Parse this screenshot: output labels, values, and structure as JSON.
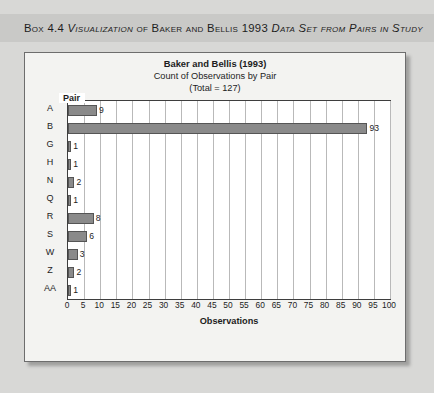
{
  "box": {
    "heading_prefix": "Box 4.4 ",
    "heading_italic_1": "Visualization",
    "heading_mid": " of Baker and Bellis 1993 ",
    "heading_italic_2": "Data Set from Pairs in Study",
    "heading_full": "Box 4.4 Visualization of Baker and Bellis 1993 Data Set from Pairs in Study"
  },
  "chart_data": {
    "type": "bar",
    "orientation": "horizontal",
    "title": "Baker and Bellis (1993)",
    "subtitle": "Count of Observations by Pair",
    "total_line": "(Total = 127)",
    "total": 127,
    "xlabel": "Observations",
    "ylabel": "Pair",
    "categories": [
      "A",
      "B",
      "G",
      "H",
      "N",
      "Q",
      "R",
      "S",
      "W",
      "Z",
      "AA"
    ],
    "values": [
      9,
      93,
      1,
      1,
      2,
      1,
      8,
      6,
      3,
      2,
      1
    ],
    "value_labels": [
      "9",
      "93",
      "1",
      "1",
      "2",
      "1",
      "8",
      "6",
      "3",
      "2",
      "1"
    ],
    "xlim": [
      0,
      100
    ],
    "xticks": [
      0,
      5,
      10,
      15,
      20,
      25,
      30,
      35,
      40,
      45,
      50,
      55,
      60,
      65,
      70,
      75,
      80,
      85,
      90,
      95,
      100
    ],
    "xtick_labels": [
      "0",
      "5",
      "10",
      "15",
      "20",
      "25",
      "30",
      "35",
      "40",
      "45",
      "50",
      "55",
      "60",
      "65",
      "70",
      "75",
      "80",
      "85",
      "90",
      "95",
      "100"
    ],
    "grid": true,
    "legend": "none",
    "bar_color": "#8a8a8a",
    "bar_border_color": "#555555",
    "plot_background": "#ffffff",
    "page_background": "#d8d8d6",
    "heading_band_color": "#c9c9c7"
  }
}
